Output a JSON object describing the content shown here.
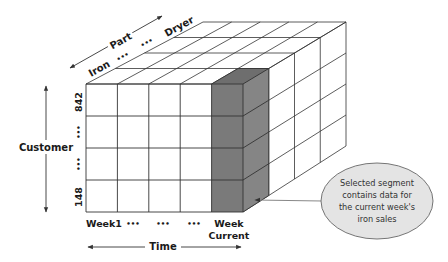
{
  "diagram": {
    "axes": {
      "part": {
        "label": "Part",
        "first": "Iron",
        "ellipsis": [
          "•••",
          "•••"
        ],
        "last": "Dryer"
      },
      "customer": {
        "label": "Customer",
        "top": "842",
        "ellipsis": [
          "•••",
          "•••"
        ],
        "bottom": "148"
      },
      "time": {
        "label": "Time",
        "columns": [
          "Week1",
          "•••",
          "•••",
          "•••"
        ],
        "current_line1": "Week",
        "current_line2": "Current"
      }
    },
    "grid": {
      "columns": 5,
      "rows": 4,
      "depth": 4,
      "selected_column_index": 4
    },
    "callout": {
      "lines": [
        "Selected segment",
        "contains data for",
        "the current week's",
        "iron sales"
      ]
    },
    "colors": {
      "line": "#333333",
      "selected_fill_front": "#7a7a7a",
      "selected_fill_top": "#6e6e6e",
      "selected_fill_side": "#858585",
      "callout_fill": "#e4e4e4",
      "callout_stroke": "#666666"
    }
  }
}
